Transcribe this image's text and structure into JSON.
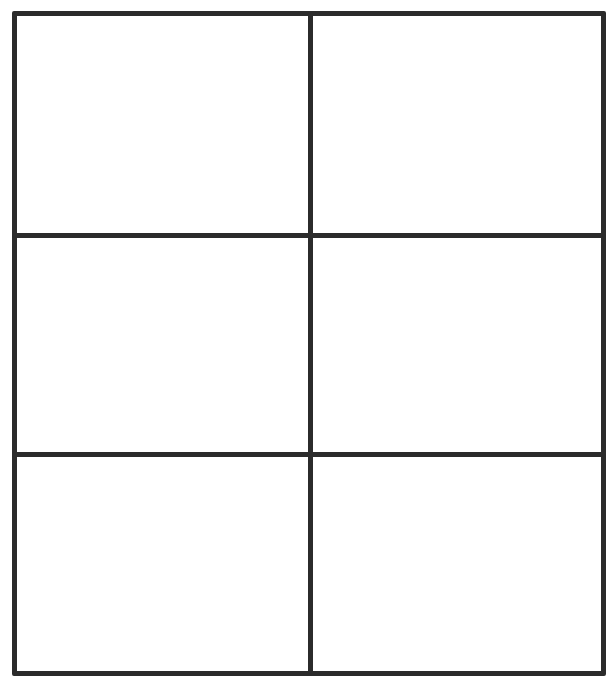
{
  "grid": {
    "rows": 3,
    "columns": 2,
    "line_color": "#2b2b2b",
    "background": "#ffffff",
    "cells": [
      {
        "row": 1,
        "col": 1,
        "content": ""
      },
      {
        "row": 1,
        "col": 2,
        "content": ""
      },
      {
        "row": 2,
        "col": 1,
        "content": ""
      },
      {
        "row": 2,
        "col": 2,
        "content": ""
      },
      {
        "row": 3,
        "col": 1,
        "content": ""
      },
      {
        "row": 3,
        "col": 2,
        "content": ""
      }
    ]
  }
}
